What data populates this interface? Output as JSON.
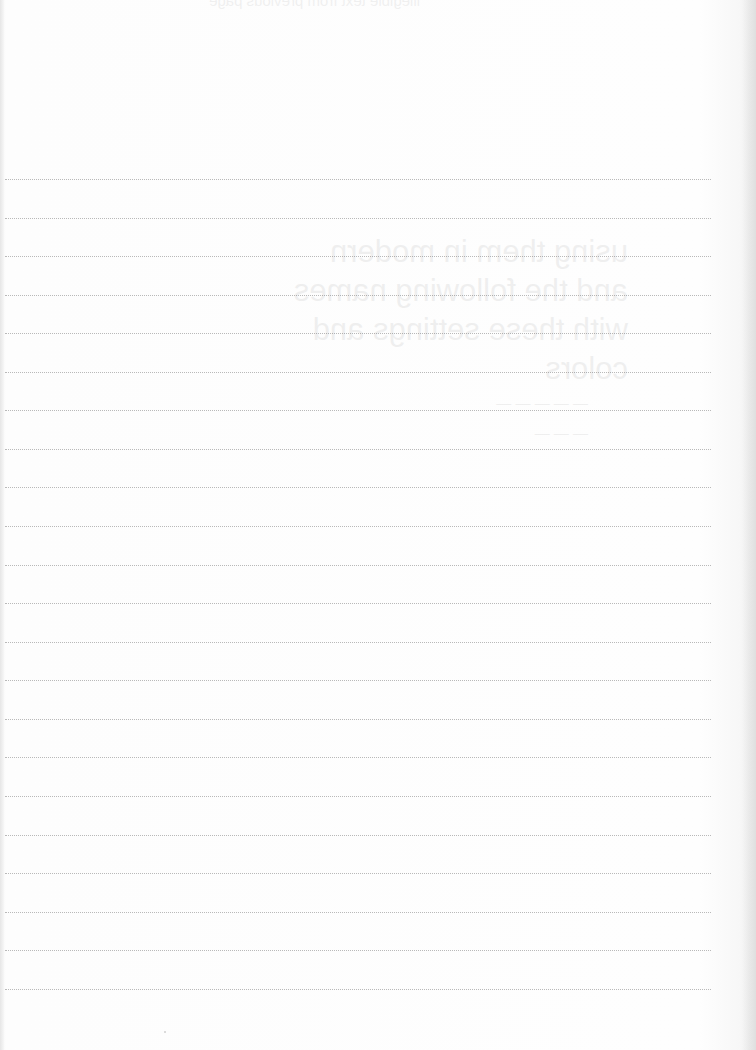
{
  "page": {
    "type": "blank-lined-notebook-page",
    "background_color": "#fdfdfd",
    "rule_color": "#b9b9b9",
    "rule_style": "dotted",
    "rule_count": 22,
    "rule_spacing_px": 38.6,
    "first_rule_y": 179
  },
  "rules": [
    {
      "y": 179
    },
    {
      "y": 218
    },
    {
      "y": 256
    },
    {
      "y": 295
    },
    {
      "y": 333
    },
    {
      "y": 372
    },
    {
      "y": 410
    },
    {
      "y": 449
    },
    {
      "y": 487
    },
    {
      "y": 526
    },
    {
      "y": 565
    },
    {
      "y": 603
    },
    {
      "y": 642
    },
    {
      "y": 680
    },
    {
      "y": 719
    },
    {
      "y": 757
    },
    {
      "y": 796
    },
    {
      "y": 835
    },
    {
      "y": 873
    },
    {
      "y": 912
    },
    {
      "y": 950
    },
    {
      "y": 989
    }
  ],
  "bleed_through": {
    "top": "illegible text from previous page",
    "lines": [
      "using them in modern",
      "and the following names",
      "with these settings and",
      "colors",
      "— — — — —",
      "— — —"
    ]
  }
}
